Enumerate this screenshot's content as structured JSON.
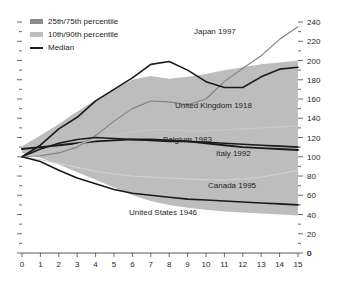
{
  "chart_data": {
    "type": "area",
    "title": "",
    "subtitle": "",
    "xlabel": "",
    "ylabel": "",
    "xlim": [
      0,
      15
    ],
    "ylim": [
      0,
      240
    ],
    "grid": false,
    "legend_position": "top-left",
    "x": [
      0,
      1,
      2,
      3,
      4,
      5,
      6,
      7,
      8,
      9,
      10,
      11,
      12,
      13,
      14,
      15
    ],
    "xticks": [
      "0",
      "1",
      "2",
      "3",
      "4",
      "5",
      "6",
      "7",
      "8",
      "9",
      "10",
      "11",
      "12",
      "13",
      "14",
      "15"
    ],
    "yticks": [
      "0",
      "20",
      "40",
      "60",
      "80",
      "100",
      "120",
      "140",
      "160",
      "180",
      "200",
      "220",
      "240"
    ],
    "bands": [
      {
        "name": "10th/90th percentile",
        "color": "#bdbdbd",
        "lower": [
          104,
          99,
          92,
          84,
          76,
          68,
          60,
          54,
          50,
          47,
          45,
          43,
          42,
          41,
          40,
          39
        ],
        "upper": [
          111,
          122,
          134,
          147,
          159,
          170,
          180,
          184,
          181,
          183,
          186,
          190,
          193,
          196,
          198,
          200
        ]
      },
      {
        "name": "25th/75th percentile",
        "color": "#8c8c8c",
        "lower": [
          107,
          104,
          100,
          95,
          90,
          86,
          83,
          81,
          79,
          78,
          77,
          76,
          75,
          74,
          73,
          72
        ],
        "upper": [
          110,
          115,
          121,
          127,
          133,
          138,
          142,
          144,
          143,
          145,
          147,
          150,
          152,
          154,
          156,
          158
        ]
      }
    ],
    "series": [
      {
        "name": "Median",
        "color": "#1a1a1a",
        "style": "line",
        "values": [
          108,
          110,
          112,
          114,
          116,
          117,
          118,
          118,
          117,
          116,
          114,
          112,
          110,
          109,
          108,
          107
        ]
      },
      {
        "name": "Japan 1997",
        "color": "#808080",
        "style": "line",
        "values": [
          100,
          101,
          104,
          110,
          122,
          137,
          150,
          158,
          157,
          154,
          160,
          178,
          192,
          205,
          222,
          235
        ]
      },
      {
        "name": "United Kingdom 1918",
        "color": "#1a1a1a",
        "style": "line",
        "values": [
          100,
          112,
          129,
          141,
          158,
          170,
          182,
          196,
          199,
          190,
          178,
          172,
          172,
          183,
          191,
          193
        ]
      },
      {
        "name": "Belgium 1983",
        "color": "#c8c8c8",
        "style": "line",
        "values": [
          100,
          103,
          108,
          113,
          118,
          122,
          126,
          128,
          128,
          127,
          127,
          128,
          129,
          130,
          131,
          132
        ]
      },
      {
        "name": "Italy 1992",
        "color": "#1a1a1a",
        "style": "line",
        "values": [
          100,
          108,
          114,
          118,
          120,
          119,
          118,
          117,
          116,
          116,
          115,
          114,
          113,
          112,
          111,
          110
        ]
      },
      {
        "name": "Canada 1995",
        "color": "#d0d0d0",
        "style": "line",
        "values": [
          100,
          97,
          93,
          89,
          85,
          82,
          80,
          79,
          78,
          77,
          76,
          76,
          77,
          79,
          82,
          86
        ]
      },
      {
        "name": "United States 1946",
        "color": "#1a1a1a",
        "style": "line",
        "values": [
          100,
          95,
          86,
          78,
          72,
          66,
          62,
          60,
          58,
          56,
          55,
          54,
          53,
          52,
          51,
          50
        ]
      }
    ],
    "annotations": [
      {
        "text": "Japan 1997",
        "x": 194,
        "y": 27
      },
      {
        "text": "United Kingdom 1918",
        "x": 175,
        "y": 101
      },
      {
        "text": "Belgium 1983",
        "x": 163,
        "y": 135
      },
      {
        "text": "Italy 1992",
        "x": 216,
        "y": 149
      },
      {
        "text": "Canada 1995",
        "x": 208,
        "y": 181
      },
      {
        "text": "United States 1946",
        "x": 129,
        "y": 208
      }
    ],
    "legend": [
      {
        "label": "25th/75th percentile",
        "swatch": "#8c8c8c",
        "kind": "box"
      },
      {
        "label": "10th/90th percentile",
        "swatch": "#bdbdbd",
        "kind": "box"
      },
      {
        "label": "Median",
        "swatch": "#1a1a1a",
        "kind": "line"
      }
    ]
  },
  "colors": {
    "background": "#ffffff",
    "axis": "#5a5a5a",
    "text": "#231f20",
    "band_inner": "#8c8c8c",
    "band_outer": "#bdbdbd",
    "median_line": "#1a1a1a"
  }
}
